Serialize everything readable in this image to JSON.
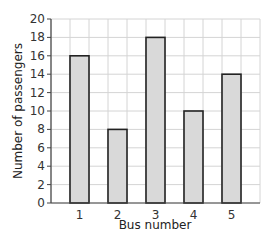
{
  "chart_data": {
    "type": "bar",
    "title": "",
    "xlabel": "Bus number",
    "ylabel": "Number of passengers",
    "categories": [
      "1",
      "2",
      "3",
      "4",
      "5"
    ],
    "values": [
      16,
      8,
      18,
      10,
      14
    ],
    "ylim": [
      0,
      20
    ],
    "yticks": [
      0,
      2,
      4,
      6,
      8,
      10,
      12,
      14,
      16,
      18,
      20
    ],
    "grid": true,
    "legend": null,
    "colors": {
      "bar_fill": "#d9d9d9",
      "bar_stroke": "#222222",
      "grid": "#d4d4d4",
      "axis": "#444444"
    }
  }
}
